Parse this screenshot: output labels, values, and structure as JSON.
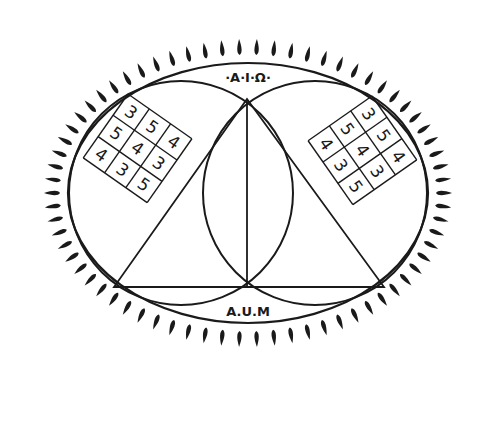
{
  "diagram": {
    "top_label": "·A·I·Ω·",
    "bottom_label": "A.U.M",
    "colors": {
      "ink": "#1a1a1a",
      "background": "#ffffff"
    },
    "rays": {
      "count": 70,
      "shape": "teardrop"
    },
    "left_square": {
      "rows": [
        [
          "3",
          "5",
          "4"
        ],
        [
          "5",
          "4",
          "3"
        ],
        [
          "4",
          "3",
          "5"
        ]
      ]
    },
    "right_square": {
      "rows": [
        [
          "3",
          "5",
          "4"
        ],
        [
          "5",
          "4",
          "3"
        ],
        [
          "4",
          "3",
          "5"
        ]
      ]
    }
  }
}
